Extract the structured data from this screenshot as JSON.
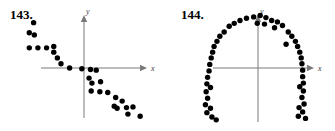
{
  "page": {
    "background_color": "#ffffff",
    "ink_color": "#000000",
    "axis_color": "#7a7a7a"
  },
  "figures": [
    {
      "id": "143",
      "label": "143.",
      "x_axis_label": "x",
      "y_axis_label": "y"
    },
    {
      "id": "144",
      "label": "144.",
      "x_axis_label": "x",
      "y_axis_label": "y"
    }
  ],
  "chart_data": [
    {
      "type": "scatter",
      "title": "143.",
      "xlabel": "x",
      "ylabel": "y",
      "grid": false,
      "legend": "none",
      "axes": "centered-cartesian-with-arrows",
      "xlim": [
        -10,
        10
      ],
      "ylim": [
        -10,
        10
      ],
      "tick_labels": {
        "x": [],
        "y": []
      },
      "relationship": "negative linear correlation",
      "marker": "filled circle",
      "series": [
        {
          "name": "data",
          "points": [
            [
              -7.0,
              6.3
            ],
            [
              -7.6,
              4.9
            ],
            [
              -6.9,
              4.6
            ],
            [
              -7.6,
              2.8
            ],
            [
              -6.4,
              2.8
            ],
            [
              -5.2,
              2.8
            ],
            [
              -4.2,
              3.0
            ],
            [
              -4.2,
              2.2
            ],
            [
              -3.7,
              1.4
            ],
            [
              -3.2,
              0.6
            ],
            [
              -2.0,
              0.0
            ],
            [
              -0.3,
              -0.1
            ],
            [
              0.9,
              -0.2
            ],
            [
              1.7,
              -0.3
            ],
            [
              0.7,
              -1.4
            ],
            [
              1.1,
              -2.1
            ],
            [
              2.3,
              -1.9
            ],
            [
              1.0,
              -3.2
            ],
            [
              2.2,
              -3.3
            ],
            [
              3.3,
              -3.4
            ],
            [
              4.4,
              -4.1
            ],
            [
              5.3,
              -4.6
            ],
            [
              4.2,
              -5.3
            ],
            [
              4.6,
              -5.6
            ],
            [
              5.9,
              -5.5
            ],
            [
              6.8,
              -5.4
            ],
            [
              6.1,
              -6.4
            ],
            [
              7.8,
              -6.7
            ]
          ]
        }
      ]
    },
    {
      "type": "scatter",
      "title": "144.",
      "xlabel": "x",
      "ylabel": "y",
      "grid": false,
      "legend": "none",
      "axes": "centered-cartesian-with-arrows",
      "xlim": [
        -10,
        10
      ],
      "ylim": [
        -10,
        10
      ],
      "tick_labels": {
        "x": [],
        "y": []
      },
      "relationship": "inverted parabolic / arch-shaped (no linear correlation)",
      "marker": "filled circle",
      "series": [
        {
          "name": "data",
          "points": [
            [
              -0.6,
              7.1
            ],
            [
              0.3,
              7.3
            ],
            [
              1.1,
              7.0
            ],
            [
              -1.6,
              6.9
            ],
            [
              -2.5,
              6.6
            ],
            [
              1.9,
              6.6
            ],
            [
              2.7,
              6.4
            ],
            [
              -3.3,
              6.2
            ],
            [
              -4.0,
              5.8
            ],
            [
              3.4,
              5.9
            ],
            [
              0.9,
              6.1
            ],
            [
              -0.1,
              6.2
            ],
            [
              2.3,
              5.6
            ],
            [
              -4.7,
              5.0
            ],
            [
              -5.3,
              4.4
            ],
            [
              4.2,
              5.0
            ],
            [
              4.7,
              4.4
            ],
            [
              -5.7,
              3.7
            ],
            [
              5.2,
              3.7
            ],
            [
              -6.1,
              3.0
            ],
            [
              5.5,
              3.0
            ],
            [
              3.9,
              3.3
            ],
            [
              -6.3,
              2.2
            ],
            [
              5.8,
              2.2
            ],
            [
              -6.5,
              1.4
            ],
            [
              6.0,
              1.4
            ],
            [
              -6.7,
              0.5
            ],
            [
              6.1,
              0.6
            ],
            [
              -6.8,
              -0.4
            ],
            [
              6.2,
              -0.3
            ],
            [
              -7.0,
              -1.3
            ],
            [
              6.2,
              -1.2
            ],
            [
              -7.1,
              -2.2
            ],
            [
              6.3,
              -2.1
            ],
            [
              -6.6,
              -2.7
            ],
            [
              5.8,
              -2.6
            ],
            [
              -7.2,
              -3.3
            ],
            [
              6.3,
              -3.2
            ],
            [
              -7.0,
              -4.2
            ],
            [
              6.1,
              -4.1
            ],
            [
              -7.3,
              -5.1
            ],
            [
              6.4,
              -5.0
            ],
            [
              -6.6,
              -5.6
            ],
            [
              5.7,
              -5.5
            ],
            [
              -7.1,
              -6.2
            ],
            [
              6.2,
              -6.1
            ],
            [
              -6.4,
              -6.8
            ],
            [
              5.6,
              -6.7
            ],
            [
              -5.8,
              -7.2
            ],
            [
              6.6,
              -7.0
            ]
          ]
        }
      ]
    }
  ]
}
